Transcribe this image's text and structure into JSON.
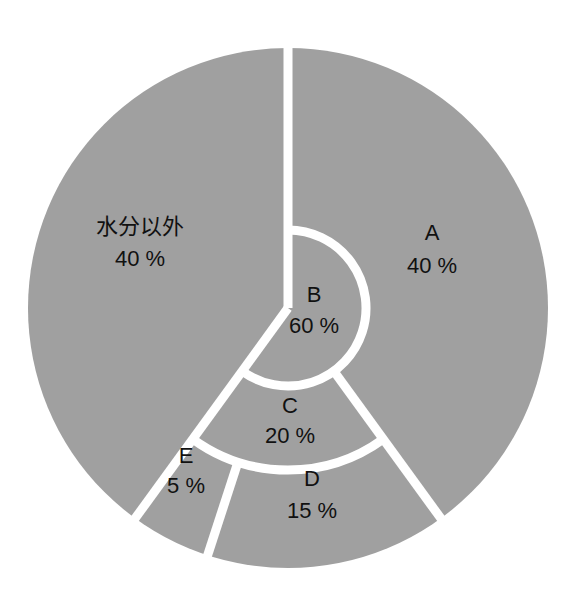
{
  "chart_data": {
    "type": "pie",
    "subtype": "nested-sunburst",
    "title": "",
    "style": {
      "fill": "#a0a0a0",
      "separator": "#ffffff",
      "text": "#111111"
    },
    "geometry": {
      "cx": 288,
      "cy": 308,
      "r_outer": 260,
      "r_inner_b": 78,
      "r_c_outer": 162,
      "start_angle_deg": 0,
      "direction": "clockwise"
    },
    "segments": [
      {
        "id": "A",
        "label": "A",
        "value": 40,
        "value_label": "40 %",
        "ring": "outer-full",
        "start_pct": 0,
        "end_pct": 40
      },
      {
        "id": "B",
        "label": "B",
        "value": 60,
        "value_label": "60 %",
        "ring": "inner",
        "start_pct": 0,
        "end_pct": 60
      },
      {
        "id": "C",
        "label": "C",
        "value": 20,
        "value_label": "20 %",
        "ring": "middle",
        "start_pct": 40,
        "end_pct": 60
      },
      {
        "id": "D",
        "label": "D",
        "value": 15,
        "value_label": "15 %",
        "ring": "outer",
        "start_pct": 40,
        "end_pct": 55
      },
      {
        "id": "E",
        "label": "E",
        "value": 5,
        "value_label": "5 %",
        "ring": "outer",
        "start_pct": 55,
        "end_pct": 60
      },
      {
        "id": "other",
        "label": "水分以外",
        "value": 40,
        "value_label": "40 %",
        "ring": "outer-full",
        "start_pct": 60,
        "end_pct": 100
      }
    ],
    "labels": [
      {
        "id": "other",
        "name": "水分以外",
        "pct": "40 %",
        "x": 140,
        "y1": 234,
        "y2": 266
      },
      {
        "id": "A",
        "name": "A",
        "pct": "40 %",
        "x": 432,
        "y1": 240,
        "y2": 273
      },
      {
        "id": "B",
        "name": "B",
        "pct": "60 %",
        "x": 314,
        "y1": 302,
        "y2": 333
      },
      {
        "id": "C",
        "name": "C",
        "pct": "20 %",
        "x": 290,
        "y1": 413,
        "y2": 443
      },
      {
        "id": "E",
        "name": "E",
        "pct": "5 %",
        "x": 186,
        "y1": 463,
        "y2": 493
      },
      {
        "id": "D",
        "name": "D",
        "pct": "15 %",
        "x": 312,
        "y1": 486,
        "y2": 518
      }
    ],
    "legend": null,
    "xlabel": "",
    "ylabel": ""
  }
}
